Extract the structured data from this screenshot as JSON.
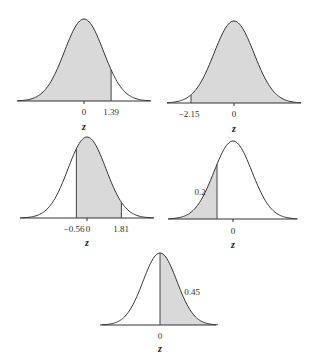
{
  "figure": {
    "axis_variable": "z",
    "shade_color": "#d9d9d9",
    "line_color": "#333333"
  },
  "chart_data": [
    {
      "type": "area",
      "title": "",
      "xlabel": "z",
      "distribution": "standard normal",
      "shaded_region": {
        "from": null,
        "to": 1.39,
        "description": "area left of z = 1.39"
      },
      "tick_labels": [
        "0",
        "1.39"
      ],
      "annotations": []
    },
    {
      "type": "area",
      "title": "",
      "xlabel": "z",
      "distribution": "standard normal",
      "shaded_region": {
        "from": -2.15,
        "to": null,
        "description": "area right of z = -2.15"
      },
      "tick_labels": [
        "-2.15",
        "0"
      ],
      "annotations": []
    },
    {
      "type": "area",
      "title": "",
      "xlabel": "z",
      "distribution": "standard normal",
      "shaded_region": {
        "from": -0.56,
        "to": 1.81,
        "description": "area between z = -0.56 and z = 1.81"
      },
      "tick_labels": [
        "-0.56",
        "0",
        "1.81"
      ],
      "annotations": []
    },
    {
      "type": "area",
      "title": "",
      "xlabel": "z",
      "distribution": "standard normal",
      "shaded_region": {
        "from": null,
        "to": -0.84,
        "description": "left tail with area 0.2"
      },
      "tick_labels": [
        "0"
      ],
      "annotations": [
        "0.2"
      ]
    },
    {
      "type": "area",
      "title": "",
      "xlabel": "z",
      "distribution": "standard normal",
      "shaded_region": {
        "from": 0,
        "to": null,
        "description": "area from z = 0 rightward labeled 0.45"
      },
      "tick_labels": [
        "0"
      ],
      "annotations": [
        "0.45"
      ]
    }
  ],
  "panels": [
    {
      "ticks": [
        {
          "label": "0"
        },
        {
          "label": "1.39"
        }
      ],
      "zlabel": "z"
    },
    {
      "ticks": [
        {
          "label": "−2.15"
        },
        {
          "label": "0"
        }
      ],
      "zlabel": "z"
    },
    {
      "ticks": [
        {
          "label": "−0.56"
        },
        {
          "label": "0"
        },
        {
          "label": "1.81"
        }
      ],
      "zlabel": "z"
    },
    {
      "ticks": [
        {
          "label": "0"
        }
      ],
      "zlabel": "z",
      "area_label": "0.2"
    },
    {
      "ticks": [
        {
          "label": "0"
        }
      ],
      "zlabel": "z",
      "area_label": "0.45"
    }
  ]
}
